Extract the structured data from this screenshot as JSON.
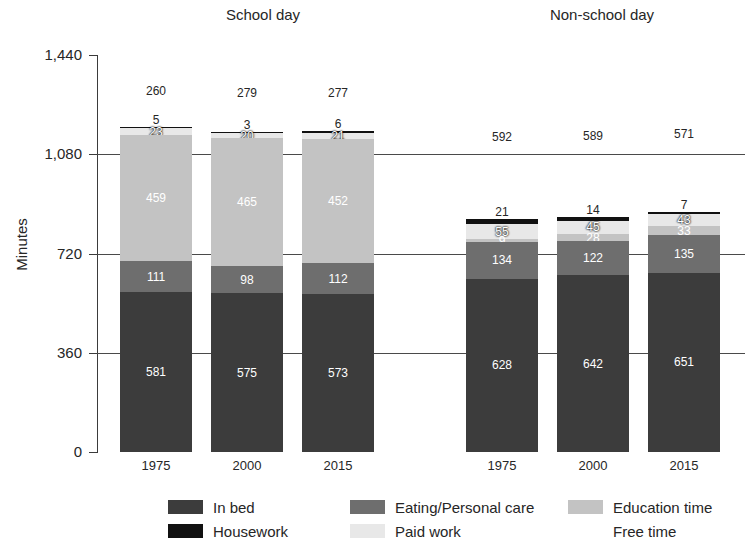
{
  "chart_data": {
    "type": "bar",
    "subtype": "stacked-bar",
    "title": "",
    "xlabel": "",
    "ylabel": "Minutes",
    "ylim": [
      0,
      1440
    ],
    "yticks": [
      "0",
      "360",
      "720",
      "1,080",
      "1,440"
    ],
    "ytick_values": [
      0,
      360,
      720,
      1080,
      1440
    ],
    "grid": "horizontal",
    "legend_position": "bottom",
    "stack_order_bottom_to_top": [
      "In bed",
      "Eating/Personal care",
      "Education time",
      "Paid work",
      "Housework",
      "Free time"
    ],
    "groups": [
      {
        "name": "School day",
        "categories": [
          "1975",
          "2000",
          "2015"
        ]
      },
      {
        "name": "Non-school day",
        "categories": [
          "1975",
          "2000",
          "2015"
        ]
      }
    ],
    "series": [
      {
        "name": "In bed",
        "values": [
          581,
          575,
          573,
          628,
          642,
          651
        ]
      },
      {
        "name": "Eating/Personal care",
        "values": [
          111,
          98,
          112,
          134,
          122,
          135
        ]
      },
      {
        "name": "Education time",
        "values": [
          459,
          465,
          452,
          9,
          28,
          33
        ]
      },
      {
        "name": "Paid work",
        "values": [
          23,
          20,
          21,
          55,
          45,
          43
        ]
      },
      {
        "name": "Housework",
        "values": [
          5,
          3,
          6,
          21,
          14,
          7
        ]
      },
      {
        "name": "Free time",
        "values": [
          260,
          279,
          277,
          592,
          589,
          571
        ]
      }
    ],
    "colors": {
      "In bed": "#3c3c3c",
      "Eating/Personal care": "#6e6e6e",
      "Education time": "#c3c3c3",
      "Paid work": "#e8e8e8",
      "Housework": "#111111",
      "Free time": "#ffffff",
      "axis": "#3b3b3b",
      "gridline": "#4a4a4a",
      "text": "#262626",
      "background": "#ffffff"
    }
  },
  "axis": {
    "y_title": "Minutes",
    "y_ticks": [
      {
        "label": "1,440",
        "value": 1440
      },
      {
        "label": "1,080",
        "value": 1080
      },
      {
        "label": "720",
        "value": 720
      },
      {
        "label": "360",
        "value": 360
      },
      {
        "label": "0",
        "value": 0
      }
    ]
  },
  "groups": {
    "school": {
      "title": "School day"
    },
    "nonschool": {
      "title": "Non-school day"
    }
  },
  "bars": [
    {
      "id": "school-1975",
      "group": "School day",
      "year": "1975",
      "in_bed": "581",
      "eating": "111",
      "education": "459",
      "paid_work": "23",
      "housework": "5",
      "free_time": "260"
    },
    {
      "id": "school-2000",
      "group": "School day",
      "year": "2000",
      "in_bed": "575",
      "eating": "98",
      "education": "465",
      "paid_work": "20",
      "housework": "3",
      "free_time": "279"
    },
    {
      "id": "school-2015",
      "group": "School day",
      "year": "2015",
      "in_bed": "573",
      "eating": "112",
      "education": "452",
      "paid_work": "21",
      "housework": "6",
      "free_time": "277"
    },
    {
      "id": "nonschool-1975",
      "group": "Non-school day",
      "year": "1975",
      "in_bed": "628",
      "eating": "134",
      "education": "9",
      "paid_work": "55",
      "housework": "21",
      "free_time": "592"
    },
    {
      "id": "nonschool-2000",
      "group": "Non-school day",
      "year": "2000",
      "in_bed": "642",
      "eating": "122",
      "education": "28",
      "paid_work": "45",
      "housework": "14",
      "free_time": "589"
    },
    {
      "id": "nonschool-2015",
      "group": "Non-school day",
      "year": "2015",
      "in_bed": "651",
      "eating": "135",
      "education": "33",
      "paid_work": "43",
      "housework": "7",
      "free_time": "571"
    }
  ],
  "legend": {
    "items": [
      {
        "label": "In bed",
        "color": "#3c3c3c",
        "row": 0,
        "col": 0
      },
      {
        "label": "Housework",
        "color": "#111111",
        "row": 1,
        "col": 0
      },
      {
        "label": "Eating/Personal care",
        "color": "#6e6e6e",
        "row": 0,
        "col": 1
      },
      {
        "label": "Paid work",
        "color": "#e8e8e8",
        "row": 1,
        "col": 1
      },
      {
        "label": "Education time",
        "color": "#c3c3c3",
        "row": 0,
        "col": 2
      },
      {
        "label": "Free time",
        "color": "#ffffff",
        "row": 1,
        "col": 2
      }
    ]
  }
}
